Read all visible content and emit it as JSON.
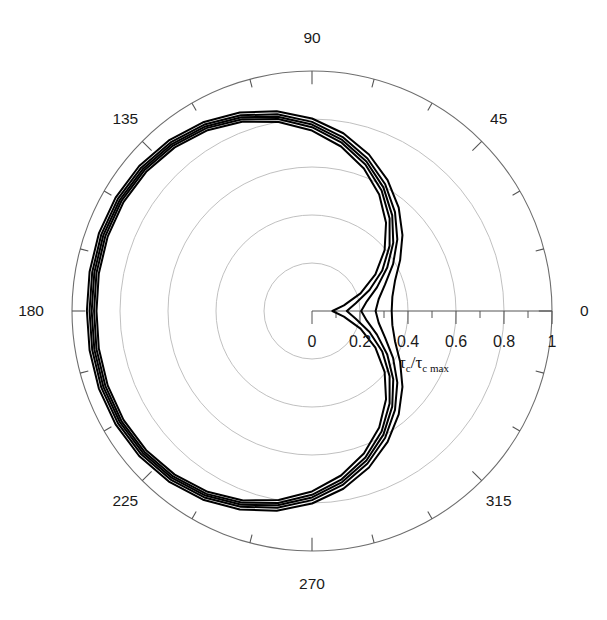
{
  "chart_data": {
    "type": "line",
    "projection": "polar",
    "title": "",
    "subtitle": "",
    "xlabel": "",
    "ylabel": "",
    "radial_axis_label": "τ_c/τ_c max",
    "radial_axis_label_parts": {
      "tau1": "τ",
      "sub1": "c",
      "slash": "/",
      "tau2": "τ",
      "sub2": "c max"
    },
    "grid": true,
    "legend": "none",
    "angular_unit": "degrees",
    "angular_tick_labels": [
      "0",
      "45",
      "90",
      "135",
      "180",
      "225",
      "270",
      "315"
    ],
    "angular_tick_values": [
      0,
      45,
      90,
      135,
      180,
      225,
      270,
      315
    ],
    "angular_minor_tick_step": 15,
    "radial_tick_labels": [
      "0",
      "0.2",
      "0.4",
      "0.6",
      "0.8",
      "1"
    ],
    "radial_tick_values": [
      0,
      0.2,
      0.4,
      0.6,
      0.8,
      1.0
    ],
    "radial_minor_tick_step": 0.1,
    "rlim": [
      0,
      1
    ],
    "grid_circle_radii": [
      0.2,
      0.4,
      0.6,
      0.8,
      1.0
    ],
    "n_series": 5,
    "series": [
      {
        "name": "curve-1",
        "r_at_0deg": 0.085,
        "r_max": 0.905,
        "theta": [
          0,
          10,
          20,
          30,
          40,
          50,
          60,
          70,
          80,
          90,
          100,
          110,
          120,
          130,
          140,
          150,
          160,
          170,
          180,
          190,
          200,
          210,
          220,
          230,
          240,
          250,
          260,
          270,
          280,
          290,
          300,
          310,
          320,
          330,
          340,
          350,
          360
        ],
        "r": [
          0.085,
          0.135,
          0.215,
          0.305,
          0.395,
          0.48,
          0.56,
          0.632,
          0.696,
          0.752,
          0.8,
          0.84,
          0.87,
          0.89,
          0.902,
          0.907,
          0.906,
          0.902,
          0.898,
          0.902,
          0.906,
          0.907,
          0.902,
          0.89,
          0.87,
          0.84,
          0.8,
          0.752,
          0.696,
          0.632,
          0.56,
          0.48,
          0.395,
          0.305,
          0.215,
          0.135,
          0.085
        ]
      },
      {
        "name": "curve-2",
        "r_at_0deg": 0.145,
        "r_max": 0.915,
        "theta": [
          0,
          10,
          20,
          30,
          40,
          50,
          60,
          70,
          80,
          90,
          100,
          110,
          120,
          130,
          140,
          150,
          160,
          170,
          180,
          190,
          200,
          210,
          220,
          230,
          240,
          250,
          260,
          270,
          280,
          290,
          300,
          310,
          320,
          330,
          340,
          350,
          360
        ],
        "r": [
          0.145,
          0.185,
          0.255,
          0.338,
          0.422,
          0.503,
          0.58,
          0.65,
          0.712,
          0.766,
          0.812,
          0.85,
          0.88,
          0.9,
          0.912,
          0.917,
          0.916,
          0.912,
          0.908,
          0.912,
          0.916,
          0.917,
          0.912,
          0.9,
          0.88,
          0.85,
          0.812,
          0.766,
          0.712,
          0.65,
          0.58,
          0.503,
          0.422,
          0.338,
          0.255,
          0.185,
          0.145
        ]
      },
      {
        "name": "curve-3",
        "r_at_0deg": 0.205,
        "r_max": 0.925,
        "theta": [
          0,
          10,
          20,
          30,
          40,
          50,
          60,
          70,
          80,
          90,
          100,
          110,
          120,
          130,
          140,
          150,
          160,
          170,
          180,
          190,
          200,
          210,
          220,
          230,
          240,
          250,
          260,
          270,
          280,
          290,
          300,
          310,
          320,
          330,
          340,
          350,
          360
        ],
        "r": [
          0.205,
          0.232,
          0.288,
          0.362,
          0.442,
          0.52,
          0.595,
          0.663,
          0.724,
          0.777,
          0.822,
          0.859,
          0.888,
          0.908,
          0.92,
          0.925,
          0.925,
          0.921,
          0.918,
          0.921,
          0.925,
          0.925,
          0.92,
          0.908,
          0.888,
          0.859,
          0.822,
          0.777,
          0.724,
          0.663,
          0.595,
          0.52,
          0.442,
          0.362,
          0.288,
          0.232,
          0.205
        ]
      },
      {
        "name": "curve-4",
        "r_at_0deg": 0.265,
        "r_max": 0.935,
        "theta": [
          0,
          10,
          20,
          30,
          40,
          50,
          60,
          70,
          80,
          90,
          100,
          110,
          120,
          130,
          140,
          150,
          160,
          170,
          180,
          190,
          200,
          210,
          220,
          230,
          240,
          250,
          260,
          270,
          280,
          290,
          300,
          310,
          320,
          330,
          340,
          350,
          360
        ],
        "r": [
          0.265,
          0.282,
          0.324,
          0.39,
          0.464,
          0.538,
          0.61,
          0.676,
          0.736,
          0.788,
          0.832,
          0.868,
          0.897,
          0.917,
          0.929,
          0.934,
          0.934,
          0.93,
          0.927,
          0.93,
          0.934,
          0.934,
          0.929,
          0.917,
          0.897,
          0.868,
          0.832,
          0.788,
          0.736,
          0.676,
          0.61,
          0.538,
          0.464,
          0.39,
          0.324,
          0.282,
          0.265
        ]
      },
      {
        "name": "curve-5",
        "r_at_0deg": 0.332,
        "r_max": 0.945,
        "theta": [
          0,
          10,
          20,
          30,
          40,
          50,
          60,
          70,
          80,
          90,
          100,
          110,
          120,
          130,
          140,
          150,
          160,
          170,
          180,
          190,
          200,
          210,
          220,
          230,
          240,
          250,
          260,
          270,
          280,
          290,
          300,
          310,
          320,
          330,
          340,
          350,
          360
        ],
        "r": [
          0.332,
          0.34,
          0.368,
          0.424,
          0.492,
          0.562,
          0.63,
          0.694,
          0.752,
          0.802,
          0.845,
          0.88,
          0.908,
          0.928,
          0.94,
          0.945,
          0.945,
          0.941,
          0.938,
          0.941,
          0.945,
          0.945,
          0.94,
          0.928,
          0.908,
          0.88,
          0.845,
          0.802,
          0.752,
          0.694,
          0.63,
          0.562,
          0.492,
          0.424,
          0.368,
          0.34,
          0.332
        ]
      }
    ]
  },
  "geometry": {
    "center_x": 312,
    "center_y": 311,
    "outer_radius": 240
  }
}
